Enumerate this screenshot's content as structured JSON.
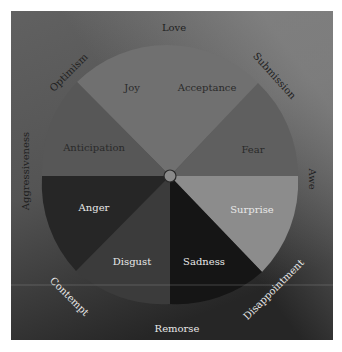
{
  "diagram": {
    "center": {
      "x": 170,
      "y": 176
    },
    "radius": 128,
    "colors": {
      "background_top": "#5d5d5d",
      "background_bottom": "#2a2a2a",
      "joy_acceptance": "#707070",
      "anticipation": "#575757",
      "fear": "#5f5f5f",
      "anger": "#262626",
      "disgust": "#3b3b3b",
      "sadness": "#151515",
      "surprise": "#8c8c8c",
      "hub": "#8a8a8a",
      "dark_text": "#1e1e1e",
      "light_text": "#e8e8e8"
    },
    "primary_emotions": {
      "joy": "Joy",
      "acceptance": "Acceptance",
      "fear": "Fear",
      "surprise": "Surprise",
      "sadness": "Sadness",
      "disgust": "Disgust",
      "anger": "Anger",
      "anticipation": "Anticipation"
    },
    "dyads": {
      "love": "Love",
      "submission": "Submission",
      "awe": "Awe",
      "disappointment": "Disappointment",
      "remorse": "Remorse",
      "contempt": "Contempt",
      "aggressiveness": "Aggressiveness",
      "optimism": "Optimism"
    }
  }
}
